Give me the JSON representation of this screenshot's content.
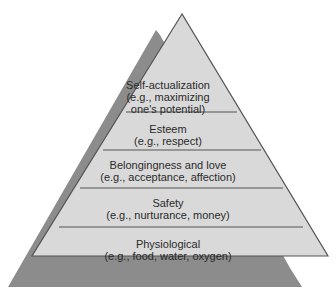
{
  "diagram": {
    "type": "pyramid",
    "colors": {
      "face": "#d9d9d9",
      "shadow": "#8c8c8c",
      "edge": "#555555",
      "text": "#2a2a2a"
    },
    "levels": [
      {
        "title": "Self-actualization",
        "example_line1": "(e.g., maximizing",
        "example_line2": "one's potential)"
      },
      {
        "title": "Esteem",
        "example_line1": "(e.g., respect)"
      },
      {
        "title": "Belongingness and love",
        "example_line1": "(e.g., acceptance, affection)"
      },
      {
        "title": "Safety",
        "example_line1": "(e.g., nurturance, money)"
      },
      {
        "title": "Physiological",
        "example_line1": "(e.g., food, water, oxygen)"
      }
    ]
  }
}
